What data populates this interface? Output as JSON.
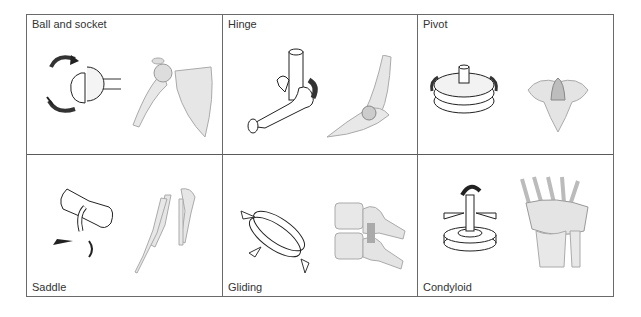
{
  "diagram": {
    "joints": [
      {
        "name": "Ball and socket",
        "schematic": "ball-socket-schematic",
        "anatomy": "shoulder-joint"
      },
      {
        "name": "Hinge",
        "schematic": "hinge-schematic",
        "anatomy": "elbow-joint"
      },
      {
        "name": "Pivot",
        "schematic": "pivot-schematic",
        "anatomy": "atlas-axis-vertebra"
      },
      {
        "name": "Saddle",
        "schematic": "saddle-schematic",
        "anatomy": "thumb-carpometacarpal"
      },
      {
        "name": "Gliding",
        "schematic": "gliding-schematic",
        "anatomy": "vertebral-facets"
      },
      {
        "name": "Condyloid",
        "schematic": "condyloid-schematic",
        "anatomy": "wrist-joint"
      }
    ]
  }
}
